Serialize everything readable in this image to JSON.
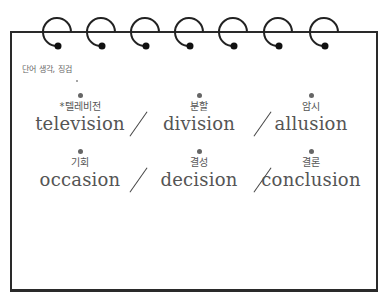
{
  "notepad": {
    "topic_label": "단어 생각, 징검",
    "ring_count": 7,
    "colors": {
      "frame": "#2a2a2a",
      "text": "#555555",
      "label": "#666666"
    }
  },
  "words": [
    {
      "korean": "*텔레비전",
      "english": "television"
    },
    {
      "korean": "분할",
      "english": "division"
    },
    {
      "korean": "암시",
      "english": "allusion"
    },
    {
      "korean": "기회",
      "english": "occasion"
    },
    {
      "korean": "결성",
      "english": "decision"
    },
    {
      "korean": "결론",
      "english": "conclusion"
    }
  ]
}
